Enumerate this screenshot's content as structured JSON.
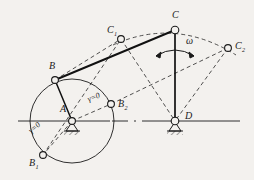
{
  "figure": {
    "background_color": "#f3f1ee",
    "ink_color": "#1a1a1a",
    "width": 254,
    "height": 180
  },
  "labels": {
    "A": "A",
    "B": "B",
    "B1_main": "B",
    "B1_sub": "1",
    "B2_main": "B",
    "B2_sub": "2",
    "C": "C",
    "C1_main": "C",
    "C1_sub": "1",
    "C2_main": "C",
    "C2_sub": "2",
    "D": "D",
    "omega": "ω",
    "gamma_zero_upper": "γ=0",
    "gamma_zero_lower": "γ=0"
  },
  "geometry": {
    "ground_line_y": 121,
    "ground_line_x_start": 18,
    "ground_line_x_end": 240,
    "pivot_A": {
      "x": 72,
      "y": 121,
      "label": "A",
      "type": "fixed-pivot-grounded"
    },
    "pivot_D": {
      "x": 175,
      "y": 121,
      "label": "D",
      "type": "fixed-pivot-grounded"
    },
    "crank_circle": {
      "cx": 72,
      "cy": 121,
      "r": 42,
      "style": "solid",
      "meaning": "crank-B-path"
    },
    "joints": [
      {
        "id": "B",
        "x": 55,
        "y": 80,
        "r": 3.4,
        "style": "solid"
      },
      {
        "id": "B1",
        "x": 43,
        "y": 155,
        "r": 3.4,
        "style": "solid"
      },
      {
        "id": "B2",
        "x": 111,
        "y": 104,
        "r": 3.4,
        "style": "solid"
      },
      {
        "id": "C",
        "x": 175,
        "y": 30,
        "r": 3.8,
        "style": "solid"
      },
      {
        "id": "C1",
        "x": 121,
        "y": 39,
        "r": 3.4,
        "style": "solid"
      },
      {
        "id": "C2",
        "x": 228,
        "y": 48,
        "r": 3.4,
        "style": "solid"
      },
      {
        "id": "A",
        "x": 72,
        "y": 121,
        "r": 3.4,
        "style": "solid"
      },
      {
        "id": "D",
        "x": 175,
        "y": 121,
        "r": 3.8,
        "style": "solid"
      }
    ],
    "solid_links": [
      {
        "from": "A",
        "to": "B",
        "meaning": "crank-AB"
      },
      {
        "from": "B",
        "to": "C",
        "meaning": "coupler-BC"
      },
      {
        "from": "C",
        "to": "D",
        "meaning": "rocker-CD"
      }
    ],
    "dashed_links": [
      {
        "from": "B1",
        "to": "C1",
        "meaning": "coupler-position-1"
      },
      {
        "from": "C1",
        "to": "D",
        "meaning": "rocker-position-1"
      },
      {
        "from": "B2",
        "to": "C2",
        "meaning": "coupler-position-2"
      },
      {
        "from": "C2",
        "to": "D",
        "meaning": "rocker-position-2"
      },
      {
        "from": "A",
        "to": "B2",
        "meaning": "crank-extended-gamma-0"
      },
      {
        "from": "A",
        "to": "B1",
        "meaning": "crank-folded-gamma-0"
      },
      {
        "from": "B1",
        "to": "C1b",
        "meaning": "toggle-line-lower"
      }
    ],
    "dashed_arc_C": {
      "through": [
        "C1",
        "C",
        "C2"
      ],
      "meaning": "rocker-end-C-path"
    },
    "omega_arrow": {
      "cx": 175,
      "cy": 52,
      "r": 22,
      "double_headed": true,
      "meaning": "angular-velocity-of-rocker"
    }
  },
  "annotations": [
    {
      "text": "γ=0",
      "near": "B2",
      "meaning": "transmission-angle-zero-extended"
    },
    {
      "text": "γ=0",
      "near": "B1",
      "meaning": "transmission-angle-zero-folded"
    },
    {
      "text": "ω",
      "near": "C",
      "meaning": "angular-velocity"
    }
  ]
}
